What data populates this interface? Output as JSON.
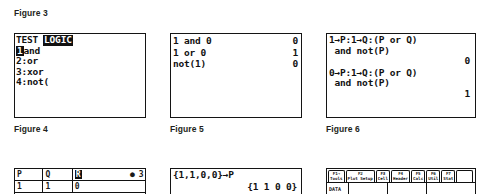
{
  "captions": {
    "fig3": "Figure 3",
    "fig4": "Figure 4",
    "fig5": "Figure 5",
    "fig6": "Figure 6"
  },
  "figure4": {
    "menu_bar_left": "TEST",
    "menu_bar_selected": "LOGIC",
    "items": [
      {
        "num": "1",
        "sep": ":",
        "label": "and",
        "selected": true
      },
      {
        "num": "2",
        "sep": ":",
        "label": "or",
        "selected": false
      },
      {
        "num": "3",
        "sep": ":",
        "label": "xor",
        "selected": false
      },
      {
        "num": "4",
        "sep": ":",
        "label": "not(",
        "selected": false
      }
    ]
  },
  "figure5": {
    "entries": [
      {
        "expr": "1 and 0",
        "result": "0"
      },
      {
        "expr": "1 or 0",
        "result": "1"
      },
      {
        "expr": "not(1)",
        "result": "0"
      }
    ]
  },
  "figure6": {
    "entries": [
      {
        "line1": "1→P:1→Q:(P or Q)",
        "line2": " and not(P)",
        "result": "0"
      },
      {
        "line1": "0→P:1→Q:(P or Q)",
        "line2": " and not(P)",
        "result": "1"
      }
    ]
  },
  "figure7": {
    "columns": [
      "P",
      "Q",
      "R"
    ],
    "selected_column_index": 2,
    "cell_marker": "●",
    "cell_ref": "3",
    "rows": [
      [
        "1",
        "1",
        "0"
      ]
    ]
  },
  "figure8": {
    "expr": "{1,1,0,0}→P",
    "result": "{1 1 0 0}"
  },
  "figure9": {
    "toolbar": [
      {
        "key": "F1→",
        "label": "Tools"
      },
      {
        "key": "F2",
        "label": "Plot Setup"
      },
      {
        "key": "F3",
        "label": "Cell"
      },
      {
        "key": "F4",
        "label": "Header"
      },
      {
        "key": "F5",
        "label": "Calc"
      },
      {
        "key": "F6",
        "label": "Util"
      },
      {
        "key": "F7",
        "label": "Stat"
      }
    ],
    "data_label": "DATA"
  },
  "colors": {
    "ink": "#141414",
    "paper": "#ffffff",
    "caption": "#231f20"
  }
}
